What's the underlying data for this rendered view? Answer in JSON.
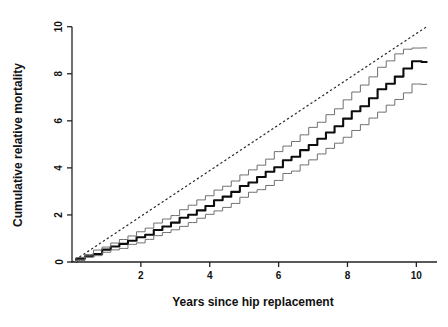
{
  "chart_data": {
    "type": "line",
    "title": "",
    "xlabel": "Years since hip replacement",
    "ylabel": "Cumulative relative mortality",
    "xlim": [
      0,
      10.6
    ],
    "ylim": [
      0,
      10.2
    ],
    "xticks": [
      2,
      4,
      6,
      8,
      10
    ],
    "xtick_labels": [
      "2",
      "4",
      "6",
      "8",
      "10"
    ],
    "yticks": [
      0,
      2,
      4,
      6,
      8,
      10
    ],
    "ytick_labels": [
      "0",
      "2",
      "4",
      "6",
      "8",
      "10"
    ],
    "grid": false,
    "legend": "none",
    "x": [
      0,
      0.25,
      0.5,
      0.75,
      1,
      1.25,
      1.5,
      1.75,
      2,
      2.25,
      2.5,
      2.75,
      3,
      3.25,
      3.5,
      3.75,
      4,
      4.25,
      4.5,
      4.75,
      5,
      5.25,
      5.5,
      5.75,
      6,
      6.25,
      6.5,
      6.75,
      7,
      7.25,
      7.5,
      7.75,
      8,
      8.25,
      8.5,
      8.75,
      9,
      9.25,
      9.5,
      9.75,
      10,
      10.3
    ],
    "series": [
      {
        "name": "Cumulative relative mortality (estimate)",
        "style": "solid-thick",
        "color": "#0d0d0d",
        "values": [
          0,
          0.14,
          0.25,
          0.36,
          0.5,
          0.64,
          0.77,
          0.9,
          1.05,
          1.2,
          1.35,
          1.5,
          1.68,
          1.85,
          2.02,
          2.2,
          2.4,
          2.58,
          2.76,
          2.95,
          3.2,
          3.42,
          3.6,
          3.8,
          4.05,
          4.3,
          4.5,
          4.72,
          5.0,
          5.25,
          5.5,
          5.78,
          6.1,
          6.4,
          6.65,
          6.95,
          7.3,
          7.6,
          7.9,
          8.2,
          8.5,
          8.5
        ]
      },
      {
        "name": "Upper 95% confidence limit",
        "style": "solid-thin",
        "color": "#6f6f6f",
        "values": [
          0,
          0.2,
          0.33,
          0.47,
          0.63,
          0.8,
          0.95,
          1.1,
          1.28,
          1.45,
          1.62,
          1.8,
          2.0,
          2.2,
          2.4,
          2.6,
          2.82,
          3.02,
          3.22,
          3.44,
          3.7,
          3.95,
          4.15,
          4.38,
          4.66,
          4.92,
          5.15,
          5.4,
          5.7,
          5.98,
          6.25,
          6.55,
          6.9,
          7.25,
          7.5,
          7.85,
          8.25,
          8.55,
          8.85,
          9.05,
          9.1,
          9.1
        ]
      },
      {
        "name": "Lower 95% confidence limit",
        "style": "solid-thin",
        "color": "#6f6f6f",
        "values": [
          0,
          0.08,
          0.17,
          0.26,
          0.38,
          0.5,
          0.61,
          0.72,
          0.85,
          0.98,
          1.1,
          1.24,
          1.4,
          1.55,
          1.7,
          1.86,
          2.03,
          2.2,
          2.36,
          2.52,
          2.74,
          2.94,
          3.1,
          3.28,
          3.5,
          3.72,
          3.9,
          4.1,
          4.35,
          4.57,
          4.8,
          5.05,
          5.33,
          5.6,
          5.82,
          6.08,
          6.4,
          6.65,
          6.92,
          7.2,
          7.55,
          7.55
        ]
      },
      {
        "name": "Reference line",
        "style": "dotted",
        "color": "#2b2b2b",
        "values": [
          0,
          0.25,
          0.5,
          0.75,
          1.0,
          1.25,
          1.5,
          1.75,
          2.0,
          2.25,
          2.5,
          2.75,
          3.0,
          3.25,
          3.5,
          3.75,
          4.0,
          4.25,
          4.5,
          4.75,
          5.0,
          5.25,
          5.5,
          5.75,
          6.0,
          6.25,
          6.5,
          6.75,
          7.0,
          7.25,
          7.5,
          7.75,
          8.0,
          8.25,
          8.5,
          8.75,
          9.0,
          9.25,
          9.5,
          9.75,
          10.0,
          10.0
        ]
      }
    ]
  }
}
